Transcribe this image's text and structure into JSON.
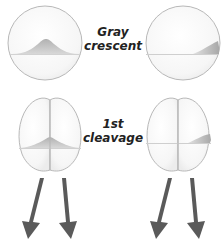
{
  "figure": {
    "labels": {
      "gray_crescent": {
        "line1": "Gray",
        "line2": "crescent"
      },
      "first_cleavage": {
        "line1": "1st",
        "line2": "cleavage"
      }
    },
    "colors": {
      "outline": "#b8b8b8",
      "cell_fill": "#f7f7f7",
      "crescent": "#b9b9b9",
      "equator_line": "#cfcfcf",
      "arrow": "#5a5a5a",
      "label_text": "#222222"
    },
    "panels": [
      {
        "id": "egg-left",
        "stage": "uncleaved egg",
        "crescent_view": "face-on"
      },
      {
        "id": "egg-right",
        "stage": "uncleaved egg",
        "crescent_view": "edge-on (right side)"
      },
      {
        "id": "two-cell-left",
        "stage": "two-cell embryo",
        "crescent_split": "equally between both cells"
      },
      {
        "id": "two-cell-right",
        "stage": "two-cell embryo",
        "crescent_split": "only in right cell"
      }
    ],
    "arrows": [
      {
        "under": "two-cell-left",
        "count": 2
      },
      {
        "under": "two-cell-right",
        "count": 2
      }
    ]
  }
}
